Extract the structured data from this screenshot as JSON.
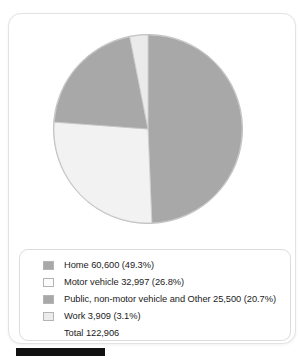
{
  "figure": {
    "title": "",
    "bottom_bar_color": "#111111"
  },
  "chart_data": {
    "type": "pie",
    "title": "",
    "xlabel": "",
    "ylabel": "",
    "legend_position": "bottom",
    "grid": false,
    "total_label": "Total 122,906",
    "total_value": 122906,
    "start_angle_deg": 0,
    "direction": "clockwise",
    "categories": [
      "Home",
      "Motor vehicle",
      "Public, non-motor vehicle and Other",
      "Work"
    ],
    "values": [
      60600,
      32997,
      25500,
      3909
    ],
    "percentages": [
      49.3,
      26.8,
      20.7,
      3.1
    ],
    "colors": [
      "#a8a8a8",
      "#f2f2f2",
      "#a8a8a8",
      "#ebebeb"
    ],
    "slices": [
      {
        "name": "Home",
        "value": 60600,
        "value_text": "60,600",
        "percent": 49.3,
        "percent_text": "(49.3%)",
        "color": "#a8a8a8",
        "legend_text": "Home 60,600 (49.3%)"
      },
      {
        "name": "Motor vehicle",
        "value": 32997,
        "value_text": "32,997",
        "percent": 26.8,
        "percent_text": "(26.8%)",
        "color": "#f2f2f2",
        "legend_text": "Motor vehicle 32,997 (26.8%)"
      },
      {
        "name": "Public, non-motor vehicle and Other",
        "value": 25500,
        "value_text": "25,500",
        "percent": 20.7,
        "percent_text": "(20.7%)",
        "color": "#a8a8a8",
        "legend_text": "Public, non-motor vehicle and Other 25,500 (20.7%)"
      },
      {
        "name": "Work",
        "value": 3909,
        "value_text": "3,909",
        "percent": 3.1,
        "percent_text": "(3.1%)",
        "color": "#ebebeb",
        "legend_text": "Work 3,909 (3.1%)"
      }
    ]
  },
  "legend": {
    "rows": [
      {
        "label": "Home 60,600 (49.3%)",
        "swatch": "#a8a8a8",
        "has_swatch": true
      },
      {
        "label": "Motor vehicle 32,997 (26.8%)",
        "swatch": "#fbfbfb",
        "has_swatch": true
      },
      {
        "label": "Public, non-motor vehicle and Other 25,500 (20.7%)",
        "swatch": "#a8a8a8",
        "has_swatch": true
      },
      {
        "label": "Work 3,909 (3.1%)",
        "swatch": "#ececec",
        "has_swatch": true
      },
      {
        "label": "Total 122,906",
        "swatch": "",
        "has_swatch": false
      }
    ]
  }
}
